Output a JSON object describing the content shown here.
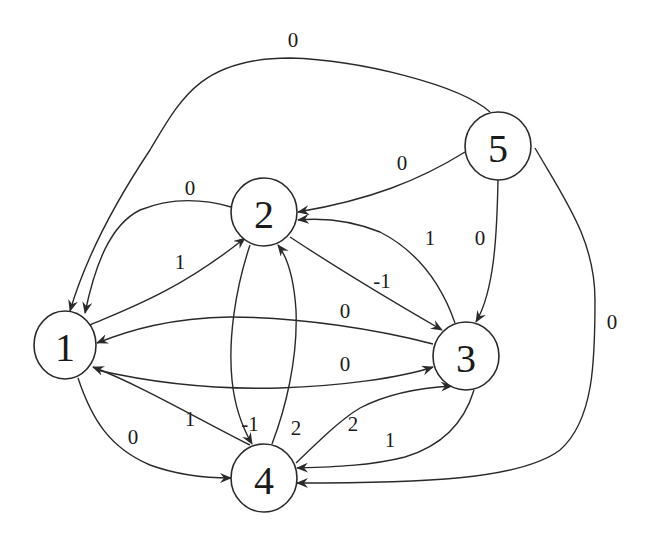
{
  "graph": {
    "type": "directed-weighted-graph",
    "nodes": [
      {
        "id": "1",
        "label": "1",
        "x": 65,
        "y": 345,
        "rx": 31,
        "ry": 34
      },
      {
        "id": "2",
        "label": "2",
        "x": 264,
        "y": 212,
        "rx": 33,
        "ry": 34
      },
      {
        "id": "3",
        "label": "3",
        "x": 466,
        "y": 356,
        "rx": 33,
        "ry": 34
      },
      {
        "id": "4",
        "label": "4",
        "x": 264,
        "y": 478,
        "rx": 33,
        "ry": 34
      },
      {
        "id": "5",
        "label": "5",
        "x": 498,
        "y": 146,
        "rx": 33,
        "ry": 34
      }
    ],
    "edges": [
      {
        "from": "5",
        "to": "1",
        "weight": "0",
        "path": "M 490 112 C 460 85 360 60 290 58 C 200 58 180 100 150 150 C 110 210 85 260 70 311",
        "label_x": 293,
        "label_y": 40
      },
      {
        "from": "5",
        "to": "2",
        "weight": "0",
        "path": "M 465 152 C 420 180 370 200 298 212",
        "label_x": 402,
        "label_y": 163
      },
      {
        "from": "2",
        "to": "1",
        "weight": "0",
        "path": "M 231 207 C 200 198 170 198 140 210 C 110 225 95 265 85 313",
        "label_x": 190,
        "label_y": 188
      },
      {
        "from": "1",
        "to": "2",
        "weight": "1",
        "path": "M 90 325 C 130 308 180 290 245 238",
        "label_x": 180,
        "label_y": 262
      },
      {
        "from": "2",
        "to": "3",
        "weight": "-1",
        "path": "M 290 237 C 340 270 390 300 442 330",
        "label_x": 382,
        "label_y": 281
      },
      {
        "from": "3",
        "to": "2",
        "weight": "1",
        "path": "M 455 323 C 440 280 415 250 380 232 C 350 220 320 218 298 220",
        "label_x": 430,
        "label_y": 238
      },
      {
        "from": "5",
        "to": "3",
        "weight": "0",
        "path": "M 498 180 C 497 230 495 290 476 322",
        "label_x": 480,
        "label_y": 238
      },
      {
        "from": "3",
        "to": "1",
        "weight": "0",
        "path": "M 433 344 C 380 330 300 317 230 317 C 170 318 130 330 97 343",
        "label_x": 345,
        "label_y": 311
      },
      {
        "from": "1",
        "to": "3",
        "weight": "0",
        "path": "M 97 370 C 140 380 200 390 280 388 C 340 386 400 378 433 367",
        "label_x": 345,
        "label_y": 364
      },
      {
        "from": "4",
        "to": "1",
        "weight": "1",
        "path": "M 250 445 C 200 420 140 385 93 367",
        "label_x": 190,
        "label_y": 419
      },
      {
        "from": "2",
        "to": "4",
        "weight": "-1",
        "path": "M 250 245 C 235 290 228 340 232 380 C 235 410 245 432 252 444",
        "label_x": 250,
        "label_y": 424
      },
      {
        "from": "4",
        "to": "2",
        "weight": "2",
        "path": "M 272 444 C 285 410 298 360 296 310 C 294 280 288 258 278 245",
        "label_x": 296,
        "label_y": 428
      },
      {
        "from": "1",
        "to": "4",
        "weight": "0",
        "path": "M 78 378 C 92 420 110 448 150 465 C 180 476 210 478 231 478",
        "label_x": 133,
        "label_y": 437
      },
      {
        "from": "4",
        "to": "3",
        "weight": "2",
        "path": "M 296 463 C 320 440 340 420 360 408 C 385 395 415 388 452 386",
        "label_x": 353,
        "label_y": 424
      },
      {
        "from": "3",
        "to": "4",
        "weight": "1",
        "path": "M 474 390 C 465 420 445 445 405 457 C 370 466 330 467 297 468",
        "label_x": 390,
        "label_y": 440
      },
      {
        "from": "5",
        "to": "4",
        "weight": "0",
        "path": "M 535 148 C 565 200 595 240 595 300 C 595 360 594 420 560 450 C 520 480 420 483 297 483",
        "label_x": 612,
        "label_y": 322
      }
    ]
  }
}
